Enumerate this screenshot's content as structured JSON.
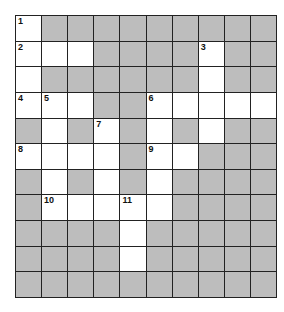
{
  "puzzle": {
    "rows": 11,
    "cols": 10,
    "colors": {
      "block": "#bdbdbd",
      "open": "#ffffff",
      "line": "#222222"
    },
    "layout": [
      "WGGGGGGGGG",
      "WWWGGGGWGG",
      "WGGGGGGWGG",
      "WWWGGWWWWW",
      "GWGWGWGWGG",
      "WWWWGWWGGG",
      "GWGWGWGGGG",
      "GWWWWWGGGG",
      "GGGGWGGGGG",
      "GGGGWGGGGG",
      "GGGGGGGGGG"
    ],
    "numbers": [
      {
        "r": 0,
        "c": 0,
        "n": "1"
      },
      {
        "r": 1,
        "c": 0,
        "n": "2"
      },
      {
        "r": 1,
        "c": 7,
        "n": "3"
      },
      {
        "r": 3,
        "c": 0,
        "n": "4"
      },
      {
        "r": 3,
        "c": 1,
        "n": "5"
      },
      {
        "r": 3,
        "c": 5,
        "n": "6"
      },
      {
        "r": 4,
        "c": 3,
        "n": "7"
      },
      {
        "r": 5,
        "c": 0,
        "n": "8"
      },
      {
        "r": 5,
        "c": 5,
        "n": "9"
      },
      {
        "r": 7,
        "c": 1,
        "n": "10"
      },
      {
        "r": 7,
        "c": 4,
        "n": "11"
      }
    ]
  }
}
